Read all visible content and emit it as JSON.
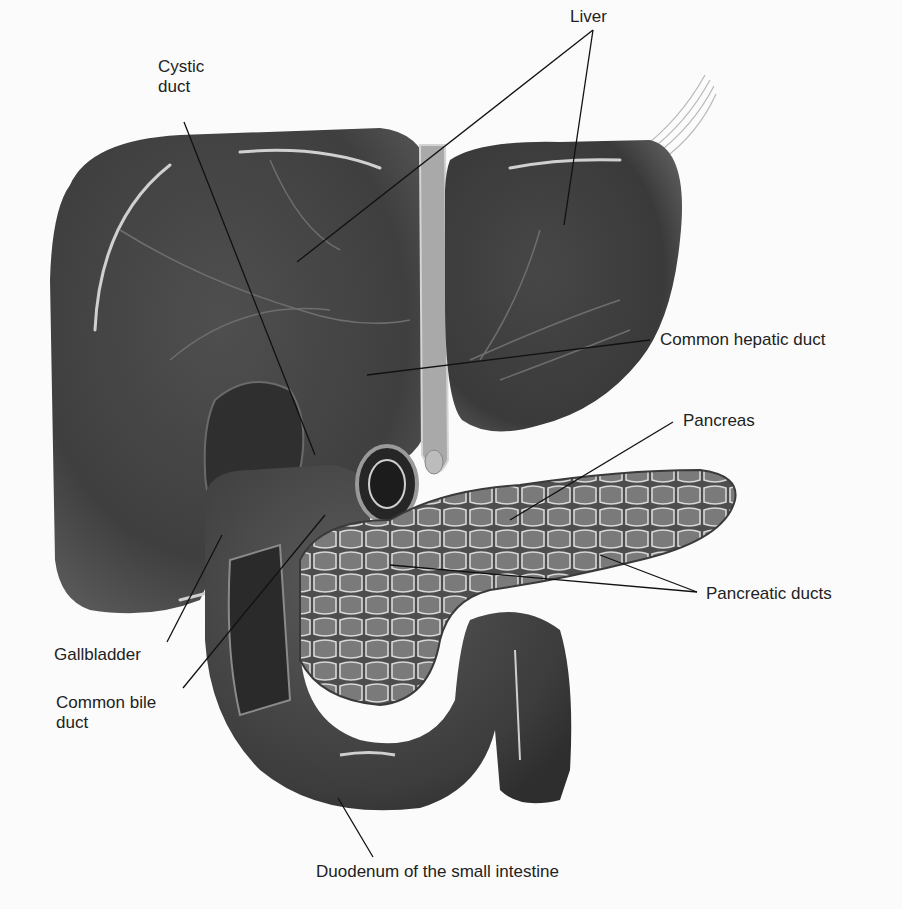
{
  "diagram": {
    "colors": {
      "background": "#fbfbfb",
      "organ_dark": "#3a3a3a",
      "organ_mid": "#4a4a4a",
      "organ_light": "#5c5c5c",
      "highlight": "#c8c8c8",
      "pancreas_cell": "#7a7a7a",
      "ligament": "#b0b0b0",
      "leader_line": "#111111",
      "text": "#222222"
    },
    "labels": [
      {
        "id": "liver",
        "text": "Liver",
        "x": 570,
        "y": 7
      },
      {
        "id": "cystic-duct",
        "text": "Cystic duct",
        "x": 158,
        "y": 57,
        "width": 60
      },
      {
        "id": "common-hepatic-duct",
        "text": "Common hepatic duct",
        "x": 660,
        "y": 330
      },
      {
        "id": "pancreas",
        "text": "Pancreas",
        "x": 683,
        "y": 411
      },
      {
        "id": "pancreatic-ducts",
        "text": "Pancreatic ducts",
        "x": 706,
        "y": 584
      },
      {
        "id": "gallbladder",
        "text": "Gallbladder",
        "x": 54,
        "y": 645
      },
      {
        "id": "common-bile-duct",
        "text": "Common bile duct",
        "x": 56,
        "y": 693,
        "width": 130
      },
      {
        "id": "duodenum",
        "text": "Duodenum of the small intestine",
        "x": 316,
        "y": 862
      }
    ],
    "leader_lines": [
      {
        "id": "liver-left",
        "x1": 593,
        "y1": 30,
        "x2": 297,
        "y2": 262
      },
      {
        "id": "liver-right",
        "x1": 593,
        "y1": 30,
        "x2": 564,
        "y2": 225
      },
      {
        "id": "cystic-duct",
        "x1": 184,
        "y1": 122,
        "x2": 315,
        "y2": 455
      },
      {
        "id": "common-hepatic-duct",
        "x1": 650,
        "y1": 340,
        "x2": 367,
        "y2": 375
      },
      {
        "id": "pancreas",
        "x1": 673,
        "y1": 422,
        "x2": 510,
        "y2": 520
      },
      {
        "id": "pancreatic-ducts-1",
        "x1": 697,
        "y1": 592,
        "x2": 390,
        "y2": 565
      },
      {
        "id": "pancreatic-ducts-2",
        "x1": 697,
        "y1": 592,
        "x2": 600,
        "y2": 555
      },
      {
        "id": "gallbladder",
        "x1": 167,
        "y1": 642,
        "x2": 222,
        "y2": 535
      },
      {
        "id": "common-bile-duct",
        "x1": 183,
        "y1": 688,
        "x2": 325,
        "y2": 515
      },
      {
        "id": "duodenum",
        "x1": 373,
        "y1": 857,
        "x2": 338,
        "y2": 798
      }
    ]
  }
}
